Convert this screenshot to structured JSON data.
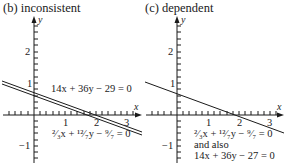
{
  "panels": [
    {
      "title": "(b)  inconsistent",
      "equations": [
        "14x + 36y − 29 = 0",
        "²⁄₃x + ¹²⁄₇y − ⁹⁄₇ = 0"
      ]
    },
    {
      "title": "(c)  dependent",
      "equations": [
        "²⁄₃x + ¹²⁄₇y − ⁹⁄₇ = 0",
        "and also",
        "14x + 36y − 27 = 0"
      ]
    }
  ],
  "axes": {
    "x_label": "x",
    "y_label": "y",
    "x_ticks": [
      "1",
      "2",
      "3"
    ],
    "y_ticks": [
      "2",
      "1",
      "−1"
    ]
  },
  "colors": {
    "ink": "#1a1a1a",
    "background": "#ffffff"
  }
}
